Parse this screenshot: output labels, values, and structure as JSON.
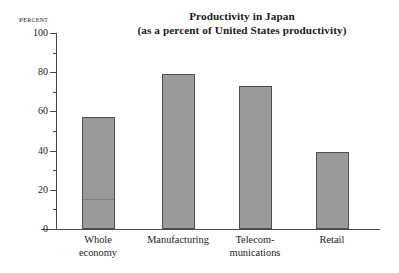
{
  "chart_data": {
    "type": "bar",
    "title": "Productivity in Japan",
    "subtitle": "(as a percent of United States productivity)",
    "axis_caption": "Percent",
    "xlabel": "",
    "ylabel": "Percent",
    "ylim": [
      0,
      100
    ],
    "ytick_step_major": 20,
    "ytick_step_minor": 10,
    "grid": false,
    "legend": null,
    "categories": [
      "Whole\neconomy",
      "Manufacturing",
      "Telecom-\nmunications",
      "Retail"
    ],
    "values": [
      57,
      79,
      73,
      39.5
    ],
    "ytick_labels": [
      "100",
      "80",
      "60",
      "40",
      "20",
      "0"
    ],
    "ytick_values": [
      100,
      80,
      60,
      40,
      20,
      0
    ],
    "minor_tick_values": [
      90,
      70,
      50,
      30,
      10
    ],
    "bar_color": "#9a9a9a",
    "bar_border_color": "#4f4f4f",
    "axis_color": "#4a4a4a",
    "text_color": "#1a1a1a"
  }
}
